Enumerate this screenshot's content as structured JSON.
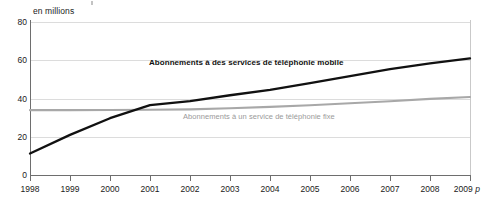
{
  "units_caption": "en millions",
  "chart_data": {
    "type": "line",
    "title": "",
    "subtitle": "",
    "xlabel": "",
    "ylabel": "en millions",
    "ylim": [
      0,
      80
    ],
    "xlim": [
      1998,
      2009
    ],
    "yticks": [
      0,
      20,
      40,
      60,
      80
    ],
    "grid": true,
    "legend_position": "inline-annotation",
    "x": [
      "1998",
      "1999",
      "2000",
      "2001",
      "2002",
      "2003",
      "2004",
      "2005",
      "2006",
      "2007",
      "2008",
      "2009"
    ],
    "xtick_labels": [
      "1998",
      "1999",
      "2000",
      "2001",
      "2002",
      "2003",
      "2004",
      "2005",
      "2006",
      "2007",
      "2008",
      "2009 p"
    ],
    "xtick_last_suffix": "p",
    "series": [
      {
        "name": "Abonnements à des services de téléphonie mobile",
        "color": "#111111",
        "style": "bold-black-line",
        "values": [
          11.2,
          21.0,
          29.7,
          36.5,
          38.6,
          41.7,
          44.5,
          48.1,
          51.7,
          55.4,
          58.4,
          61.0
        ]
      },
      {
        "name": "Abonnements à un service de téléphonie fixe",
        "color": "#a8a8a8",
        "style": "gray-line",
        "values": [
          33.9,
          33.9,
          34.0,
          34.1,
          34.3,
          34.9,
          35.6,
          36.5,
          37.5,
          38.6,
          39.8,
          40.8
        ]
      }
    ],
    "annotations": [
      {
        "id": "label-mobile",
        "text": "Abonnements à des services de téléphonie mobile",
        "color": "#111111",
        "bold": true
      },
      {
        "id": "label-fixe",
        "text": "Abonnements à un service de téléphonie fixe",
        "color": "#9a9a9a",
        "bold": false
      }
    ]
  },
  "colors": {
    "mobile_line": "#111111",
    "fixe_line": "#a8a8a8",
    "gridline": "#dcdcdc",
    "axis": "#6e6e6e",
    "background": "#ffffff"
  }
}
